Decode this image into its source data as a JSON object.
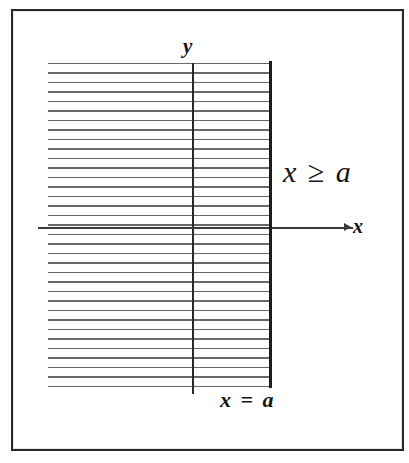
{
  "figure": {
    "background_color": "#ffffff",
    "frame_color": "#272727",
    "axis_color": "#2a2a2a",
    "hatch_color": "#5c5c5c",
    "boundary_color": "#1c1c1c",
    "labels": {
      "y_axis": "y",
      "x_axis": "x",
      "inequality": "x ≥ a",
      "boundary": "x = a"
    }
  },
  "chart_data": {
    "type": "line",
    "title": "",
    "subtitle": "",
    "xlabel": "x",
    "ylabel": "y",
    "grid": false,
    "legend": null,
    "annotations": [
      {
        "text": "x ≥ a",
        "role": "region-label",
        "x": 285,
        "y": 175
      },
      {
        "text": "x = a",
        "role": "boundary-label",
        "x": 248,
        "y": 398
      },
      {
        "text": "y",
        "role": "axis-label",
        "x": 186,
        "y": 48
      },
      {
        "text": "x",
        "role": "axis-label",
        "x": 357,
        "y": 226
      }
    ],
    "series": [
      {
        "name": "x = a",
        "kind": "vertical-line",
        "value": "a",
        "style": "solid-thick",
        "included": true
      },
      {
        "name": "x ≥ a",
        "kind": "half-plane-shaded",
        "direction": "left-of-boundary-as-drawn",
        "hatch": "horizontal-lines",
        "hatch_pitch_px": 9.5
      }
    ],
    "axes": {
      "x_axis_drawn": true,
      "y_axis_drawn": true,
      "x_axis_arrow": true,
      "tick_labels_x": [],
      "tick_labels_y": [],
      "xlim": null,
      "ylim": null
    }
  }
}
